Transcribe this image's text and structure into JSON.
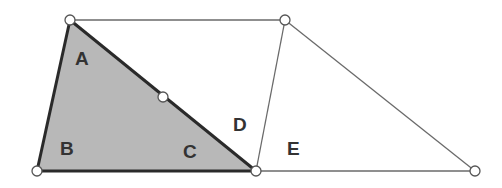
{
  "diagram": {
    "colors": {
      "shade": "#b8b8b8",
      "thick_edge": "#2a2a2a",
      "thin_edge": "#6a6a6a",
      "label": "#333333",
      "vertex_fill": "#ffffff"
    },
    "vertices": [
      {
        "id": "top-left",
        "x": 70,
        "y": 20
      },
      {
        "id": "bottom-left",
        "x": 37,
        "y": 171
      },
      {
        "id": "bottom-middle",
        "x": 256,
        "y": 171
      },
      {
        "id": "top-right",
        "x": 285,
        "y": 20
      },
      {
        "id": "bottom-right",
        "x": 475,
        "y": 171
      },
      {
        "id": "hypotenuse-midpoint",
        "x": 163,
        "y": 97
      }
    ],
    "labels": {
      "a": "A",
      "b": "B",
      "c": "C",
      "d": "D",
      "e": "E"
    }
  }
}
